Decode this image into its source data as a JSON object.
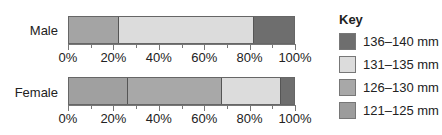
{
  "chart_data": {
    "type": "bar",
    "orientation": "horizontal",
    "stacked": true,
    "percent": true,
    "title": "",
    "xlabel": "",
    "ylabel": "",
    "xlim": [
      0,
      100
    ],
    "x_tick_labels": [
      "0%",
      "20%",
      "40%",
      "60%",
      "80%",
      "100%"
    ],
    "categories": [
      "Male",
      "Female"
    ],
    "legend": {
      "title": "Key",
      "position": "right",
      "entries": [
        "136–140 mm",
        "131–135 mm",
        "126–130 mm",
        "121–125 mm"
      ]
    },
    "series": [
      {
        "name": "121–125 mm",
        "color": "#9c9c9c",
        "values": [
          22,
          26
        ]
      },
      {
        "name": "126–130 mm",
        "color": "#a8a8a8",
        "values": [
          0,
          42
        ]
      },
      {
        "name": "131–135 mm",
        "color": "#dcdcdc",
        "values": [
          60,
          26
        ]
      },
      {
        "name": "136–140 mm",
        "color": "#6e6e6e",
        "values": [
          18,
          6
        ]
      }
    ]
  },
  "rows": [
    {
      "label": "Male",
      "segments": [
        {
          "pct": 22,
          "color": "#a4a4a4"
        },
        {
          "pct": 60,
          "color": "#dcdcdc"
        },
        {
          "pct": 18,
          "color": "#6e6e6e"
        }
      ]
    },
    {
      "label": "Female",
      "segments": [
        {
          "pct": 26,
          "color": "#a0a0a0"
        },
        {
          "pct": 42,
          "color": "#a8a8a8"
        },
        {
          "pct": 26,
          "color": "#dcdcdc"
        },
        {
          "pct": 6,
          "color": "#6e6e6e"
        }
      ]
    }
  ],
  "axis": {
    "labels": [
      "0%",
      "20%",
      "40%",
      "60%",
      "80%",
      "100%"
    ]
  },
  "key": {
    "title": "Key",
    "items": [
      {
        "label": "136–140 mm",
        "color": "#6e6e6e"
      },
      {
        "label": "131–135 mm",
        "color": "#dcdcdc"
      },
      {
        "label": "126–130 mm",
        "color": "#a8a8a8"
      },
      {
        "label": "121–125 mm",
        "color": "#9c9c9c"
      }
    ]
  }
}
